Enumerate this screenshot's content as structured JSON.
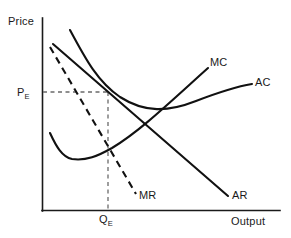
{
  "figure": {
    "kind": "economics-curve-diagram",
    "background_color": "#ffffff",
    "ink_color": "#111111",
    "guide_color": "#6a6a6a"
  },
  "axes": {
    "y_axis_label": "Price",
    "x_axis_label": "Output",
    "origin": {
      "x": 42,
      "y": 211
    },
    "y_axis_top": {
      "x": 42,
      "y": 18
    },
    "x_axis_right": {
      "x": 280,
      "y": 211
    }
  },
  "markers": {
    "price_label": "P",
    "price_subscript": "E",
    "quantity_label": "Q",
    "quantity_subscript": "E",
    "price_level_y": 92,
    "quantity_level_x": 108
  },
  "curves": [
    {
      "name": "AR",
      "label": "AR",
      "style": "solid",
      "kind": "demand-average-revenue",
      "path": "M 53 44 L 228 196"
    },
    {
      "name": "MR",
      "label": "MR",
      "style": "dashed",
      "kind": "marginal-revenue",
      "path": "M 50 47 L 136 194"
    },
    {
      "name": "AC",
      "label": "AC",
      "style": "solid",
      "kind": "average-cost",
      "path": "M 70 30 C 86 60, 98 82, 120 97 C 145 113, 168 112, 196 101 C 222 91, 240 86, 252 84"
    },
    {
      "name": "MC",
      "label": "MC",
      "style": "solid",
      "kind": "marginal-cost",
      "path": "M 50 133 C 56 146, 62 157, 72 159 C 86 161, 98 156, 112 148 C 140 131, 168 104, 208 68"
    }
  ],
  "guides": [
    {
      "name": "price-guide",
      "description": "horizontal dashed line from y-axis to tangency point",
      "path": "M 43 92 L 108 92"
    },
    {
      "name": "quantity-guide",
      "description": "vertical dashed line from tangency point down to x-axis",
      "path": "M 108 92 L 108 210"
    }
  ],
  "labels": {
    "price": "Price",
    "output": "Output",
    "mc": "MC",
    "ac": "AC",
    "ar": "AR",
    "mr": "MR"
  }
}
